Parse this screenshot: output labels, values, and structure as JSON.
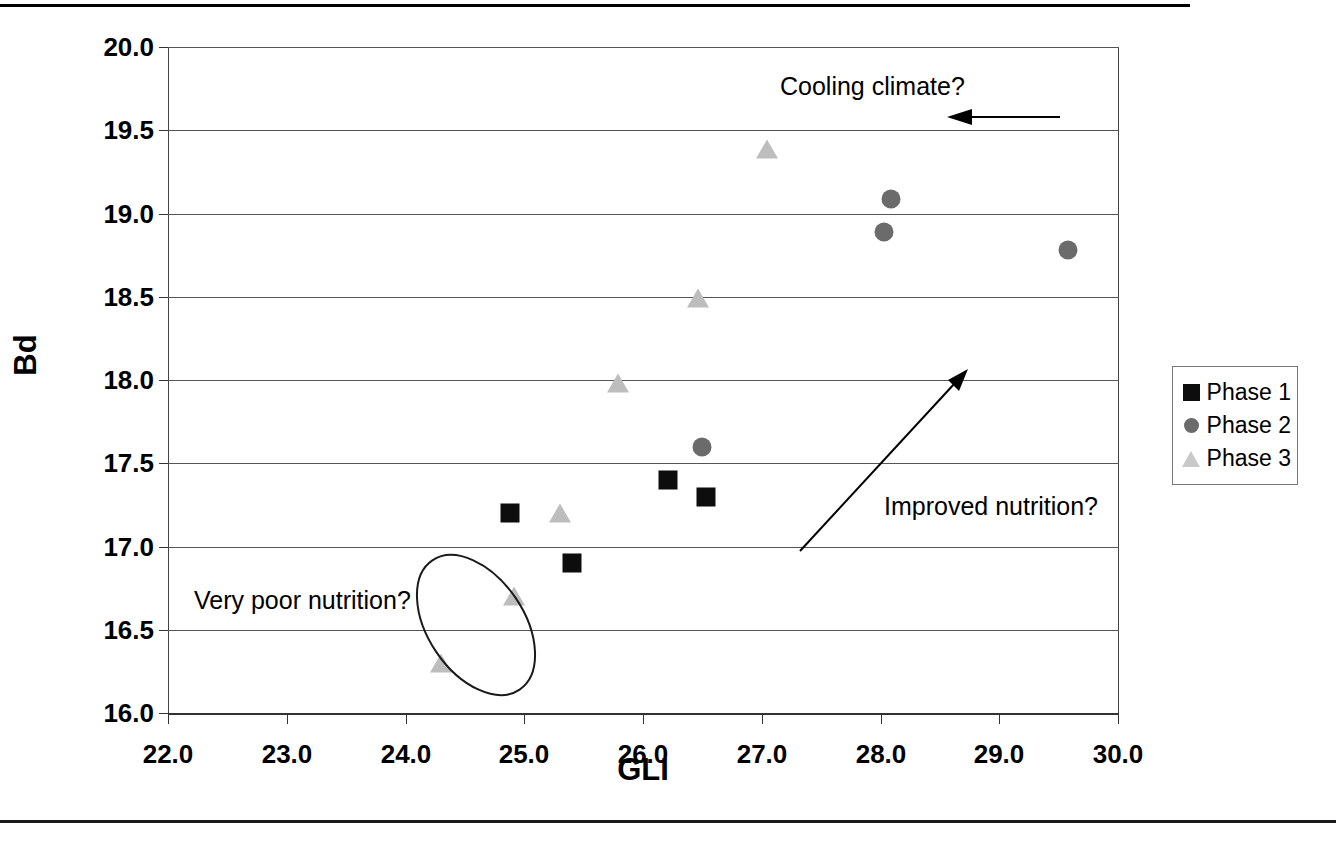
{
  "chart_data": {
    "type": "scatter",
    "title": "",
    "xlabel": "GLI",
    "ylabel": "Bd",
    "xlim": [
      22.0,
      30.0
    ],
    "ylim": [
      16.0,
      20.0
    ],
    "xticks": [
      "22.0",
      "23.0",
      "24.0",
      "25.0",
      "26.0",
      "27.0",
      "28.0",
      "29.0",
      "30.0"
    ],
    "yticks": [
      "16.0",
      "16.5",
      "17.0",
      "17.5",
      "18.0",
      "18.5",
      "19.0",
      "19.5",
      "20.0"
    ],
    "grid": "horizontal",
    "legend_position": "right",
    "series": [
      {
        "name": "Phase 1",
        "marker": "square",
        "color": "#0d0d0d",
        "points": [
          {
            "x": 24.88,
            "y": 17.2
          },
          {
            "x": 25.4,
            "y": 16.9
          },
          {
            "x": 26.21,
            "y": 17.4
          },
          {
            "x": 26.53,
            "y": 17.3
          }
        ]
      },
      {
        "name": "Phase 2",
        "marker": "circle",
        "color": "#6b6b6b",
        "points": [
          {
            "x": 26.5,
            "y": 17.6
          },
          {
            "x": 28.09,
            "y": 19.09
          },
          {
            "x": 28.03,
            "y": 18.89
          },
          {
            "x": 29.58,
            "y": 18.78
          }
        ]
      },
      {
        "name": "Phase 3",
        "marker": "triangle",
        "color": "#bdbdbd",
        "points": [
          {
            "x": 24.3,
            "y": 16.3
          },
          {
            "x": 24.91,
            "y": 16.7
          },
          {
            "x": 25.3,
            "y": 17.2
          },
          {
            "x": 25.79,
            "y": 17.98
          },
          {
            "x": 26.46,
            "y": 18.49
          },
          {
            "x": 27.04,
            "y": 19.39
          }
        ]
      }
    ],
    "annotations": [
      {
        "name": "cooling-climate",
        "text": "Cooling climate?",
        "arrow": "left"
      },
      {
        "name": "improved-nutrition",
        "text": "Improved nutrition?",
        "arrow": "up-right"
      },
      {
        "name": "very-poor-nutrition",
        "text": "Very poor nutrition?",
        "arrow": "ellipse-highlight"
      }
    ]
  },
  "legend": {
    "items": [
      {
        "label": "Phase 1",
        "marker": "square"
      },
      {
        "label": "Phase 2",
        "marker": "circle"
      },
      {
        "label": "Phase 3",
        "marker": "triangle"
      }
    ]
  }
}
